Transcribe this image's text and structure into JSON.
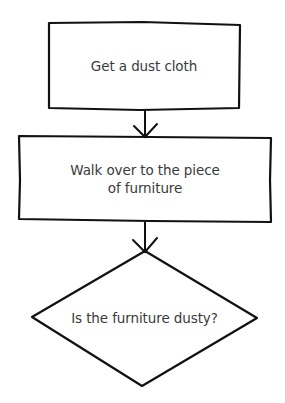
{
  "flowchart": {
    "top_fragment": "",
    "steps": [
      {
        "id": "step-1",
        "type": "process",
        "label": "Get a dust cloth"
      },
      {
        "id": "step-2",
        "type": "process",
        "label": "Walk over to the piece of furniture",
        "label_line1": "Walk over to the piece",
        "label_line2": "of furniture"
      },
      {
        "id": "step-3",
        "type": "decision",
        "label": "Is the furniture dusty?"
      }
    ],
    "connectors": [
      {
        "from": "step-1",
        "to": "step-2"
      },
      {
        "from": "step-2",
        "to": "step-3"
      }
    ],
    "colors": {
      "stroke": "#111111",
      "text": "#3a3a3a",
      "background": "#ffffff"
    }
  }
}
